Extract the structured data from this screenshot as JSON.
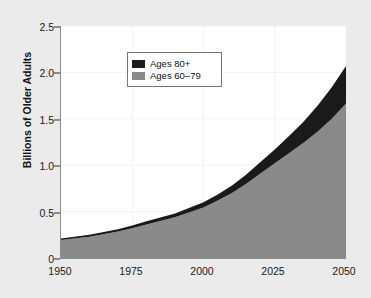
{
  "chart_data": {
    "type": "area",
    "title": "",
    "subtitle": "",
    "xlabel": "",
    "ylabel": "Billions of Older Adults",
    "stacked": true,
    "grid": true,
    "legend_position": "top-left",
    "xlim": [
      1950,
      2050
    ],
    "ylim": [
      0,
      2.5
    ],
    "x_ticks": [
      1950,
      1975,
      2000,
      2025,
      2050
    ],
    "x_tick_labels": [
      "1950",
      "1975",
      "2000",
      "2025",
      "2050"
    ],
    "y_ticks": [
      0,
      0.5,
      1.0,
      1.5,
      2.0,
      2.5
    ],
    "y_tick_labels": [
      "0",
      "0.5",
      "1.0",
      "1.5",
      "2.0",
      "2.5"
    ],
    "x": [
      1950,
      1960,
      1970,
      1975,
      1980,
      1990,
      2000,
      2005,
      2010,
      2015,
      2020,
      2025,
      2030,
      2035,
      2040,
      2045,
      2050
    ],
    "series": [
      {
        "name": "Ages 60–79",
        "color": "#8a8a8a",
        "values": [
          0.195,
          0.23,
          0.285,
          0.32,
          0.36,
          0.44,
          0.545,
          0.62,
          0.7,
          0.8,
          0.91,
          1.02,
          1.13,
          1.24,
          1.36,
          1.5,
          1.665
        ]
      },
      {
        "name": "Ages 80+",
        "color": "#1a1a1a",
        "values": [
          0.015,
          0.02,
          0.025,
          0.03,
          0.035,
          0.04,
          0.055,
          0.065,
          0.08,
          0.1,
          0.125,
          0.15,
          0.185,
          0.225,
          0.28,
          0.34,
          0.405
        ]
      }
    ],
    "totals": [
      0.21,
      0.25,
      0.31,
      0.35,
      0.395,
      0.48,
      0.6,
      0.685,
      0.78,
      0.9,
      1.035,
      1.17,
      1.315,
      1.465,
      1.64,
      1.84,
      2.07
    ],
    "legend": [
      {
        "label": "Ages 80+",
        "color": "#1a1a1a"
      },
      {
        "label": "Ages 60–79",
        "color": "#8a8a8a"
      }
    ],
    "colors": {
      "page_background": "#ebebeb",
      "plot_background": "#ffffff",
      "axis": "#8c8c8c",
      "gridline": "#f2f2f2",
      "text": "#111111"
    }
  }
}
